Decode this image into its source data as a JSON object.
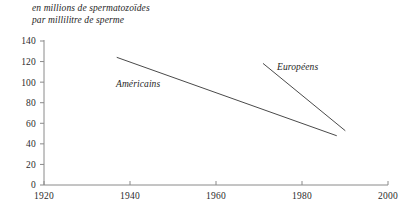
{
  "chart_data": {
    "type": "line",
    "title": "en millions de spermatozoïdes\npar millilitre de sperme",
    "title_line1": "en millions de spermatozoïdes",
    "title_line2": "par millilitre de sperme",
    "xlabel": "",
    "ylabel": "en millions de spermatozoïdes par millilitre de sperme",
    "xlim": [
      1920,
      2000
    ],
    "ylim": [
      0,
      140
    ],
    "xticks": [
      1920,
      1940,
      1960,
      1980,
      2000
    ],
    "xtick_labels": [
      "1920",
      "1940",
      "1960",
      "1980",
      "2000"
    ],
    "yticks": [
      0,
      20,
      40,
      60,
      80,
      100,
      120,
      140
    ],
    "ytick_labels": [
      "0",
      "20",
      "40",
      "60",
      "80",
      "100",
      "120",
      "140"
    ],
    "grid": false,
    "legend": "inline-labels",
    "line_color": "#4a4a4a",
    "axis_color": "#8a8a8a",
    "series": [
      {
        "name": "Américains",
        "label": "Américains",
        "x": [
          1937,
          1988
        ],
        "values": [
          124,
          48
        ]
      },
      {
        "name": "Européens",
        "label": "Européens",
        "x": [
          1971,
          1990
        ],
        "values": [
          118,
          53
        ]
      }
    ]
  }
}
